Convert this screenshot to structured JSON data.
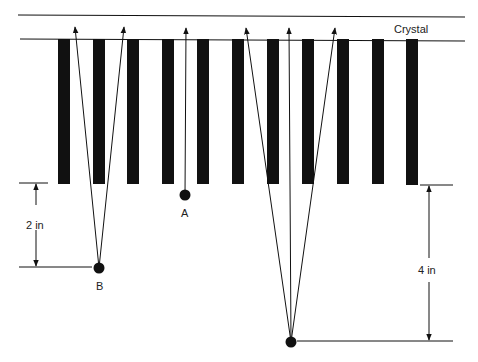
{
  "labels": {
    "crystal": "Crystal",
    "point_a": "A",
    "point_b": "B",
    "dim_2in": "2 in",
    "dim_4in": "4 in"
  },
  "colors": {
    "ink": "#111111",
    "background": "#ffffff"
  },
  "geometry": {
    "top_line_y": 16,
    "crystal_line_y": 39,
    "bars_x": [
      58,
      93,
      127,
      162,
      197,
      232,
      267,
      302,
      337,
      372,
      406
    ],
    "bar_width": 12,
    "bar_top": 39,
    "bar_bottom": 184,
    "point_a": [
      185,
      195
    ],
    "point_b": [
      99,
      268
    ],
    "point_c": [
      291,
      342
    ]
  }
}
